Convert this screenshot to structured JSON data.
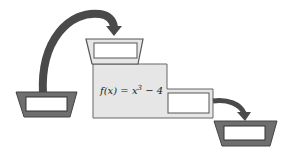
{
  "diagram": {
    "type": "function-machine",
    "function": {
      "name": "f",
      "variable": "x",
      "label_lhs": "f(x) = x",
      "exponent": "3",
      "label_rhs": " − 4"
    },
    "parts": [
      {
        "id": "input-tray",
        "description": "dark input tray with empty box"
      },
      {
        "id": "input-arrow",
        "description": "curved arrow from input tray into machine hopper"
      },
      {
        "id": "machine-hopper",
        "description": "light gray hopper with empty box on top of machine"
      },
      {
        "id": "machine-body",
        "description": "machine body displaying the function rule"
      },
      {
        "id": "output-slot",
        "description": "empty output box on machine"
      },
      {
        "id": "output-arrow",
        "description": "curved arrow from output slot to output tray"
      },
      {
        "id": "output-tray",
        "description": "dark output tray with empty box"
      }
    ],
    "colors": {
      "dark_tray": "#6e6e6e",
      "light_fill": "#e6e6e6",
      "outline": "#555555",
      "arrow": "#4a4a4a",
      "box_fill": "#ffffff"
    }
  }
}
